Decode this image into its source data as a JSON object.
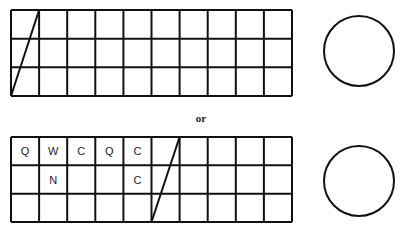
{
  "diagram": {
    "separator_label": "or",
    "grids": [
      {
        "name": "top-grid",
        "x": 11,
        "y": 10,
        "width": 281,
        "height": 86,
        "cols": 10,
        "rows": 3,
        "diagonal_column": 0,
        "letters": [
          [
            "",
            "",
            "",
            "",
            "",
            "",
            "",
            "",
            "",
            ""
          ],
          [
            "",
            "",
            "",
            "",
            "",
            "",
            "",
            "",
            "",
            ""
          ],
          [
            "",
            "",
            "",
            "",
            "",
            "",
            "",
            "",
            "",
            ""
          ]
        ]
      },
      {
        "name": "bottom-grid",
        "x": 11,
        "y": 137,
        "width": 281,
        "height": 85,
        "cols": 10,
        "rows": 3,
        "diagonal_column": 5,
        "letters": [
          [
            "Q",
            "W",
            "C",
            "Q",
            "C",
            "",
            "",
            "",
            "",
            ""
          ],
          [
            "",
            "N",
            "",
            "",
            "C",
            "",
            "",
            "",
            "",
            ""
          ],
          [
            "",
            "",
            "",
            "",
            "",
            "",
            "",
            "",
            "",
            ""
          ]
        ]
      }
    ],
    "circles": [
      {
        "name": "top-circle",
        "cx": 359,
        "cy": 51,
        "r": 35
      },
      {
        "name": "bottom-circle",
        "cx": 359,
        "cy": 181,
        "r": 35
      }
    ],
    "colors": {
      "stroke": "#111111",
      "background": "#ffffff"
    }
  }
}
